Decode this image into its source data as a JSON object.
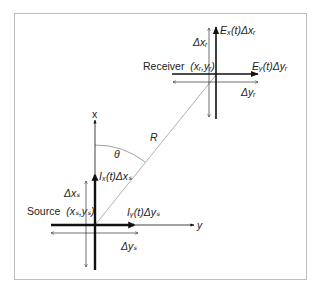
{
  "figure": {
    "frame_color": "#bdbdbd",
    "line_color": "#111111",
    "ray_color": "#9e9e9e"
  },
  "axes": {
    "x_label": "x",
    "y_label": "y"
  },
  "source": {
    "label": "Source",
    "coords_label": "(xₛ,yₛ)",
    "current_x_label": "Iₓ(t)Δxₛ",
    "current_y_label": "Iᵧ(t)Δyₛ",
    "delta_x_label": "Δxₛ",
    "delta_y_label": "Δyₛ"
  },
  "receiver": {
    "label": "Receiver",
    "coords_label": "(xᵣ,yᵣ)",
    "field_x_label": "Eₓ(t)Δxᵣ",
    "field_y_label": "Eᵧ(t)Δyᵣ",
    "delta_x_label": "Δxᵣ",
    "delta_y_label": "Δyᵣ"
  },
  "geometry": {
    "distance_label": "R",
    "angle_label": "θ"
  }
}
